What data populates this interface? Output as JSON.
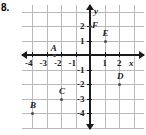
{
  "problem": {
    "number": "8."
  },
  "graph": {
    "xlabel": "x",
    "ylabel": "y",
    "x_ticks": [
      "-4",
      "-3",
      "-2",
      "-1",
      "1",
      "2"
    ],
    "y_ticks": [
      "2",
      "1",
      "-1",
      "-2",
      "-3",
      "-4"
    ],
    "grid": "on",
    "colors": {
      "grid": "#b9b9b9",
      "axis": "#1a1a1a",
      "point": "#4a4a4a"
    }
  },
  "chart_data": {
    "type": "scatter",
    "title": "",
    "xlabel": "x",
    "ylabel": "y",
    "xlim": [
      -4.8,
      2.8
    ],
    "ylim": [
      -4.8,
      2.8
    ],
    "xticks": [
      -4,
      -3,
      -2,
      -1,
      1,
      2
    ],
    "yticks": [
      2,
      1,
      -1,
      -2,
      -3,
      -4
    ],
    "grid": true,
    "legend": "none",
    "points": [
      {
        "label": "A",
        "x": -2.5,
        "y": 0
      },
      {
        "label": "B",
        "x": -4,
        "y": -4
      },
      {
        "label": "C",
        "x": -2,
        "y": -3
      },
      {
        "label": "D",
        "x": 2,
        "y": -2
      },
      {
        "label": "E",
        "x": 1,
        "y": 1
      },
      {
        "label": "F",
        "x": 0,
        "y": 2
      }
    ]
  }
}
